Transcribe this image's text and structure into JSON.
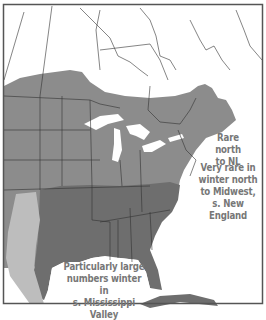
{
  "map": {
    "type": "species range map",
    "colors": {
      "background": "#ffffff",
      "border": "#555555",
      "range_migration": "#8c8c8c",
      "range_winter": "#6e6e6e",
      "range_light": "#bdbdbd",
      "water": "#ffffff",
      "lines": "#333333"
    },
    "annotations": [
      {
        "id": "rare-north",
        "text_lines": [
          "Rare north",
          "to NL"
        ]
      },
      {
        "id": "very-rare-winter",
        "text_lines": [
          "Very rare in",
          "winter north",
          "to Midwest,",
          "s. New England"
        ]
      },
      {
        "id": "mississippi",
        "text_lines": [
          "Particularly large",
          "numbers winter in",
          "s. Mississippi Valley"
        ]
      }
    ]
  }
}
